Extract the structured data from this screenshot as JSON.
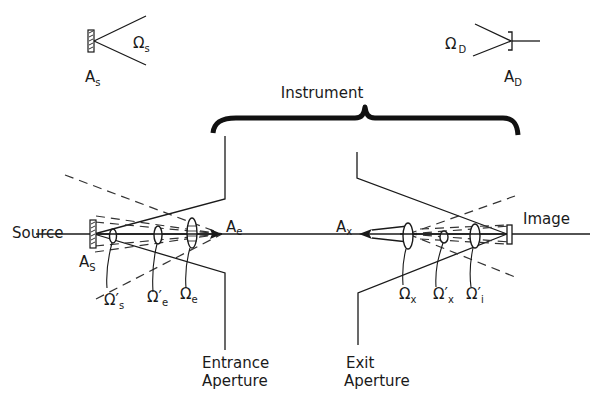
{
  "figure": {
    "top_left_inset": {
      "area_label": "A",
      "area_sub": "s",
      "solid_angle_label": "Ω",
      "solid_angle_sub": "s"
    },
    "top_right_inset": {
      "area_label": "A",
      "area_sub": "D",
      "solid_angle_label": "Ω",
      "solid_angle_sub": "D"
    },
    "brace_label": "Instrument",
    "left": {
      "source_label": "Source",
      "source_area": {
        "main": "A",
        "sub": "S"
      },
      "entrance_area": {
        "main": "A",
        "sub": "e"
      },
      "solid_angles": [
        {
          "main": "Ω′",
          "sub": "s"
        },
        {
          "main": "Ω′",
          "sub": "e"
        },
        {
          "main": "Ω",
          "sub": "e"
        }
      ],
      "aperture_label_line1": "Entrance",
      "aperture_label_line2": "Aperture"
    },
    "right": {
      "image_label": "Image",
      "exit_area": {
        "main": "A",
        "sub": "x"
      },
      "solid_angles": [
        {
          "main": "Ω",
          "sub": "x"
        },
        {
          "main": "Ω′",
          "sub": "x"
        },
        {
          "main": "Ω′",
          "sub": "i"
        }
      ],
      "aperture_label_line1": "Exit",
      "aperture_label_line2": "Aperture"
    }
  }
}
